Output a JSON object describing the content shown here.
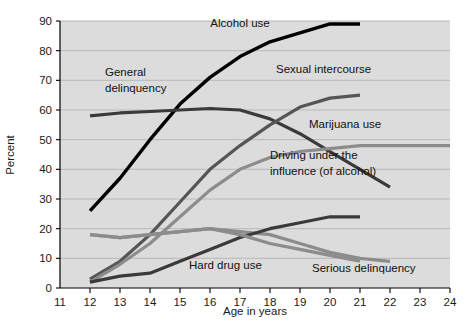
{
  "chart_data": {
    "type": "line",
    "title": "",
    "xlabel": "Age in years",
    "ylabel": "Percent",
    "xlim": [
      11,
      24
    ],
    "ylim": [
      0,
      90
    ],
    "xticks": [
      11,
      12,
      13,
      14,
      15,
      16,
      17,
      18,
      19,
      20,
      21,
      22,
      23,
      24
    ],
    "yticks": [
      0,
      10,
      20,
      30,
      40,
      50,
      60,
      70,
      80,
      90
    ],
    "grid": true,
    "legend_position": "inline-annotations",
    "plot_background": "#dcdcdc",
    "series": [
      {
        "name": "Alcohol use",
        "color": "#000000",
        "width": 3.4,
        "label_x": 17.0,
        "label_y": 88.5,
        "points": [
          {
            "x": 12,
            "y": 26
          },
          {
            "x": 13,
            "y": 37
          },
          {
            "x": 14,
            "y": 50
          },
          {
            "x": 15,
            "y": 62
          },
          {
            "x": 16,
            "y": 71
          },
          {
            "x": 17,
            "y": 78
          },
          {
            "x": 18,
            "y": 83
          },
          {
            "x": 19,
            "y": 86
          },
          {
            "x": 20,
            "y": 89
          },
          {
            "x": 21,
            "y": 89
          }
        ]
      },
      {
        "name": "General delinquency",
        "color": "#3a3a3a",
        "width": 3.2,
        "label_x": 12.6,
        "label_y": 70.5,
        "label_line2_y": 65.5,
        "points": [
          {
            "x": 12,
            "y": 58
          },
          {
            "x": 13,
            "y": 59
          },
          {
            "x": 14,
            "y": 59.5
          },
          {
            "x": 15,
            "y": 60
          },
          {
            "x": 16,
            "y": 60.5
          },
          {
            "x": 17,
            "y": 60
          },
          {
            "x": 18,
            "y": 57
          },
          {
            "x": 19,
            "y": 52
          },
          {
            "x": 20,
            "y": 46
          },
          {
            "x": 21,
            "y": 40
          },
          {
            "x": 22,
            "y": 34
          }
        ]
      },
      {
        "name": "Sexual intercourse",
        "color": "#555555",
        "width": 3.2,
        "label_x": 17.3,
        "label_y": 72.0,
        "points": [
          {
            "x": 12,
            "y": 3
          },
          {
            "x": 13,
            "y": 9
          },
          {
            "x": 14,
            "y": 18
          },
          {
            "x": 15,
            "y": 29
          },
          {
            "x": 16,
            "y": 40
          },
          {
            "x": 17,
            "y": 48
          },
          {
            "x": 18,
            "y": 55
          },
          {
            "x": 19,
            "y": 61
          },
          {
            "x": 20,
            "y": 64
          },
          {
            "x": 21,
            "y": 65
          }
        ]
      },
      {
        "name": "Marijuana use",
        "color": "#8c8c8c",
        "width": 3.2,
        "label_x": 18.6,
        "label_y": 53.5,
        "points": [
          {
            "x": 12,
            "y": 18
          },
          {
            "x": 13,
            "y": 17
          },
          {
            "x": 14,
            "y": 18
          },
          {
            "x": 15,
            "y": 19
          },
          {
            "x": 16,
            "y": 20
          },
          {
            "x": 17,
            "y": 19
          },
          {
            "x": 18,
            "y": 18
          },
          {
            "x": 19,
            "y": 15
          },
          {
            "x": 20,
            "y": 12
          },
          {
            "x": 21,
            "y": 10
          },
          {
            "x": 22,
            "y": 9
          }
        ]
      },
      {
        "name": "Driving under the influence (of alcohol)",
        "color": "#8c8c8c",
        "width": 3.2,
        "label_x": 17.5,
        "label_y": 43.0,
        "label_line2_y": 38.0,
        "points": [
          {
            "x": 12,
            "y": 2
          },
          {
            "x": 13,
            "y": 8
          },
          {
            "x": 14,
            "y": 15
          },
          {
            "x": 15,
            "y": 24
          },
          {
            "x": 16,
            "y": 33
          },
          {
            "x": 17,
            "y": 40
          },
          {
            "x": 18,
            "y": 44
          },
          {
            "x": 19,
            "y": 46
          },
          {
            "x": 20,
            "y": 47
          },
          {
            "x": 21,
            "y": 48
          },
          {
            "x": 22,
            "y": 48
          },
          {
            "x": 23,
            "y": 48
          },
          {
            "x": 24,
            "y": 48
          }
        ]
      },
      {
        "name": "Hard drug use",
        "color": "#3a3a3a",
        "width": 3.2,
        "label_x": 15.2,
        "label_y": 7.0,
        "points": [
          {
            "x": 12,
            "y": 2
          },
          {
            "x": 13,
            "y": 4
          },
          {
            "x": 14,
            "y": 5
          },
          {
            "x": 15,
            "y": 9
          },
          {
            "x": 16,
            "y": 13
          },
          {
            "x": 17,
            "y": 17
          },
          {
            "x": 18,
            "y": 20
          },
          {
            "x": 19,
            "y": 22
          },
          {
            "x": 20,
            "y": 24
          },
          {
            "x": 21,
            "y": 24
          }
        ]
      },
      {
        "name": "Serious delinquency",
        "color": "#8c8c8c",
        "width": 3.2,
        "label_x": 19.3,
        "label_y": 6.0,
        "points": [
          {
            "x": 12,
            "y": 18
          },
          {
            "x": 13,
            "y": 17
          },
          {
            "x": 14,
            "y": 18
          },
          {
            "x": 15,
            "y": 19
          },
          {
            "x": 16,
            "y": 20
          },
          {
            "x": 17,
            "y": 18
          },
          {
            "x": 18,
            "y": 15
          },
          {
            "x": 19,
            "y": 13
          },
          {
            "x": 20,
            "y": 11
          },
          {
            "x": 21,
            "y": 9
          }
        ]
      }
    ],
    "annotations": [
      {
        "text": "Alcohol use",
        "x": 17.0,
        "y": 88.0,
        "anchor": "middle"
      },
      {
        "text": "General",
        "x": 12.5,
        "y": 71.5,
        "anchor": "start"
      },
      {
        "text": "delinquency",
        "x": 12.5,
        "y": 66.0,
        "anchor": "start"
      },
      {
        "text": "Sexual intercourse",
        "x": 18.2,
        "y": 72.5,
        "anchor": "start"
      },
      {
        "text": "Marijuana use",
        "x": 19.3,
        "y": 54.0,
        "anchor": "start"
      },
      {
        "text": "Driving under the",
        "x": 18.0,
        "y": 43.5,
        "anchor": "start"
      },
      {
        "text": "influence (of alcohol)",
        "x": 18.0,
        "y": 38.0,
        "anchor": "start"
      },
      {
        "text": "Hard drug use",
        "x": 15.3,
        "y": 6.5,
        "anchor": "start"
      },
      {
        "text": "Serious delinquency",
        "x": 19.4,
        "y": 5.5,
        "anchor": "start"
      }
    ]
  },
  "axes": {
    "y_label": "Percent",
    "x_label": "Age in years",
    "y_tick_labels": [
      "0",
      "10",
      "20",
      "30",
      "40",
      "50",
      "60",
      "70",
      "80",
      "90"
    ],
    "x_tick_labels": [
      "11",
      "12",
      "13",
      "14",
      "15",
      "16",
      "17",
      "18",
      "19",
      "20",
      "21",
      "22",
      "23",
      "24"
    ]
  }
}
